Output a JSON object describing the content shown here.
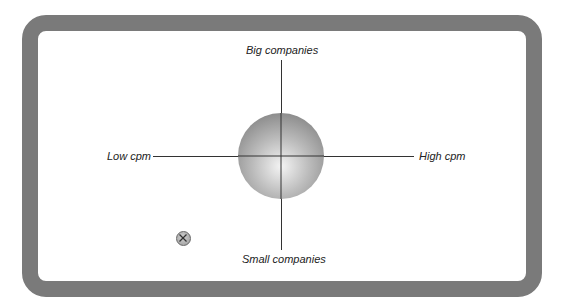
{
  "diagram": {
    "axes": {
      "top": "Big companies",
      "bottom": "Small companies",
      "left": "Low cpm",
      "right": "High cpm"
    },
    "nodes": [
      {
        "name": "central-sphere",
        "shape": "shaded-circle",
        "position": "center"
      },
      {
        "name": "x-marker",
        "shape": "circle-with-x",
        "position": "low-cpm / small-companies quadrant"
      }
    ],
    "colors": {
      "frame": "#7a7a7a",
      "axis": "#333333",
      "text": "#222222"
    }
  }
}
